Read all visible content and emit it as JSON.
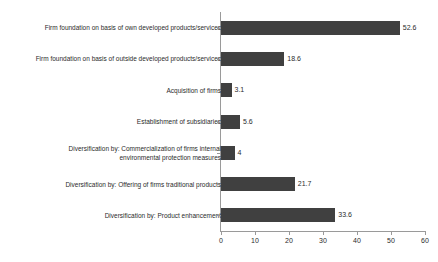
{
  "chart_data": {
    "type": "bar",
    "orientation": "horizontal",
    "title": "",
    "subtitle": "",
    "xlabel": "",
    "ylabel": "",
    "xlim": [
      0,
      60
    ],
    "xticks": [
      0,
      10,
      20,
      30,
      40,
      50,
      60
    ],
    "xtick_labels": [
      "0",
      "10",
      "20",
      "30",
      "40",
      "50",
      "60"
    ],
    "grid": false,
    "legend": null,
    "bar_color": "#404040",
    "axis_color": "#9a9a9a",
    "text_color": "#2b2b2b",
    "categories": [
      "Firm foundation on basis of own developed products/services",
      "Firm foundation on basis of outside developed products/services",
      "Acquisition of firms",
      "Establishment of subsidiaries",
      "Diversification by: Commercialization of firms internal\nenvironmental protection measures",
      "Diversification by: Offering of firms traditional products",
      "Diversification by: Product enhancement"
    ],
    "values": [
      52.6,
      18.6,
      3.1,
      5.6,
      4,
      21.7,
      33.6
    ],
    "value_labels": [
      "52.6",
      "18.6",
      "3.1",
      "5.6",
      "4",
      "21.7",
      "33.6"
    ]
  }
}
